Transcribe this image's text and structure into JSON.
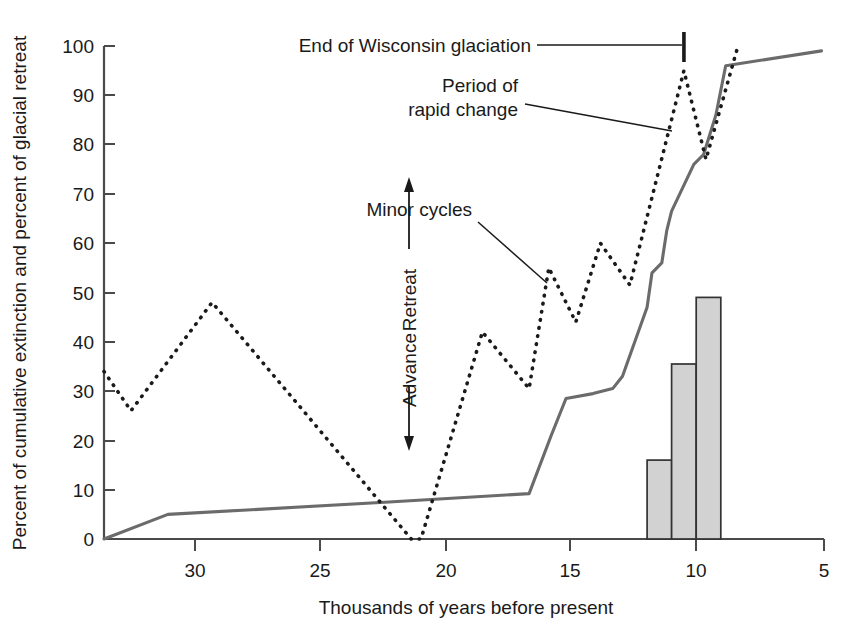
{
  "axes": {
    "y_title": "Percent of cumulative extinction and percent of glacial retreat",
    "x_title": "Thousands of years before present",
    "y_ticks": [
      "0",
      "10",
      "20",
      "30",
      "40",
      "50",
      "60",
      "70",
      "80",
      "90",
      "100"
    ],
    "x_ticks": [
      "30",
      "25",
      "20",
      "15",
      "10",
      "5"
    ]
  },
  "annotations": {
    "end_glaciation": "End of Wisconsin glaciation",
    "rapid_change_line1": "Period of",
    "rapid_change_line2": "rapid change",
    "minor_cycles": "Minor cycles",
    "retreat": "Retreat",
    "advance": "Advance"
  },
  "colors": {
    "line_solid": "#6b6b6b",
    "line_dotted": "#1a1a1a",
    "bar_fill": "#d2d2d2",
    "bar_stroke": "#333333",
    "axis": "#4a4a4a",
    "text": "#1a1a1a"
  },
  "chart_data": {
    "type": "line",
    "title": "",
    "xlabel": "Thousands of years before present",
    "ylabel": "Percent of cumulative extinction and percent of glacial retreat",
    "xlim": [
      33.6,
      4.3
    ],
    "ylim": [
      0,
      100
    ],
    "x_inverted": true,
    "grid": false,
    "legend": "none",
    "xticks": [
      30,
      25,
      20,
      15,
      10,
      5
    ],
    "yticks": [
      0,
      10,
      20,
      30,
      40,
      50,
      60,
      70,
      80,
      90,
      100
    ],
    "series": [
      {
        "name": "Percent of cumulative extinction",
        "style": "solid",
        "color": "#6b6b6b",
        "points": [
          [
            33.6,
            0
          ],
          [
            31.0,
            5
          ],
          [
            22.0,
            7.5
          ],
          [
            16.3,
            9.2
          ],
          [
            15.4,
            21
          ],
          [
            14.8,
            28.5
          ],
          [
            13.7,
            29.5
          ],
          [
            12.9,
            30.5
          ],
          [
            12.5,
            33
          ],
          [
            11.5,
            47
          ],
          [
            11.3,
            54
          ],
          [
            10.9,
            56
          ],
          [
            10.7,
            62.5
          ],
          [
            10.5,
            66.5
          ],
          [
            9.6,
            76
          ],
          [
            9.2,
            78
          ],
          [
            8.7,
            86
          ],
          [
            8.3,
            96
          ],
          [
            4.4,
            99
          ]
        ]
      },
      {
        "name": "Percent of glacial retreat",
        "style": "dotted",
        "color": "#1a1a1a",
        "points": [
          [
            33.6,
            34
          ],
          [
            32.5,
            26
          ],
          [
            29.2,
            48
          ],
          [
            21.1,
            0
          ],
          [
            20.7,
            0
          ],
          [
            18.2,
            42
          ],
          [
            16.3,
            30.5
          ],
          [
            15.5,
            55
          ],
          [
            14.4,
            44
          ],
          [
            13.4,
            60
          ],
          [
            12.2,
            51.5
          ],
          [
            10.0,
            95
          ],
          [
            9.1,
            77
          ],
          [
            7.8,
            100
          ]
        ]
      }
    ],
    "bars": {
      "name": "Extinctions per interval",
      "fill": "#d2d2d2",
      "stroke": "#333333",
      "items": [
        {
          "center": 11.0,
          "width": 1.0,
          "value": 16.0
        },
        {
          "center": 10.0,
          "width": 1.0,
          "value": 35.5
        },
        {
          "center": 9.0,
          "width": 1.0,
          "value": 49.0
        }
      ]
    },
    "markers": [
      {
        "label": "End of Wisconsin glaciation",
        "x": 10.0,
        "type": "vertical-tick"
      }
    ]
  }
}
